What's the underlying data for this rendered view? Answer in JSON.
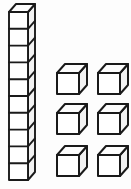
{
  "scene": {
    "title": "Base-Ten Blocks Place Value Model",
    "background_color": "#fdfdfd",
    "line_color": "#1a1a1a",
    "front_face_color": "#ffffff",
    "top_face_color": "#fdfdfd",
    "right_face_color": "#f2f2f2",
    "total_value": "16"
  },
  "rod": {
    "label": "tens-rod",
    "unit_count": "10",
    "place_value": "tens",
    "value": "10",
    "orientation": "vertical",
    "front_left_x": 9,
    "front_top_y": 12,
    "cell_width": 19,
    "cell_height": 16.8,
    "depth_dx": 7,
    "depth_dy": -8,
    "stroke_width": 1.9
  },
  "units": {
    "label": "ones-cubes",
    "count": "6",
    "place_value": "ones",
    "value": "6",
    "columns": "2",
    "rows": "3",
    "cube_front_width": 22,
    "cube_front_height": 21,
    "depth_dx": 8,
    "depth_dy": -9,
    "stroke_width": 2.0,
    "positions": [
      {
        "name": "unit-cube-1",
        "x": 57,
        "y": 73
      },
      {
        "name": "unit-cube-2",
        "x": 98,
        "y": 73
      },
      {
        "name": "unit-cube-3",
        "x": 57,
        "y": 113
      },
      {
        "name": "unit-cube-4",
        "x": 98,
        "y": 113
      },
      {
        "name": "unit-cube-5",
        "x": 57,
        "y": 155
      },
      {
        "name": "unit-cube-6",
        "x": 98,
        "y": 155
      }
    ]
  }
}
